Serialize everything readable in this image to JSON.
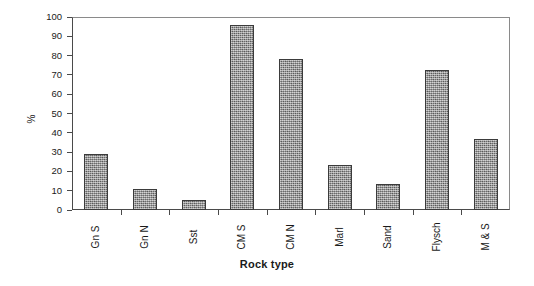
{
  "chart_data": {
    "type": "bar",
    "title": "",
    "subtitle": "",
    "xlabel": "Rock type",
    "ylabel": "%",
    "categories": [
      "Gn S",
      "Gn N",
      "Sst",
      "CM S",
      "CM N",
      "Marl",
      "Sand",
      "Flysch",
      "M & S"
    ],
    "values": [
      29,
      11,
      5,
      96,
      78.5,
      23.5,
      13.5,
      72.5,
      37
    ],
    "ylim": [
      0,
      100
    ],
    "ytick_labels": [
      "0",
      "10",
      "20",
      "30",
      "40",
      "50",
      "60",
      "70",
      "80",
      "90",
      "100"
    ],
    "ytick_values": [
      0,
      10,
      20,
      30,
      40,
      50,
      60,
      70,
      80,
      90,
      100
    ],
    "grid": false,
    "legend": false,
    "legend_position": "none",
    "bar_fill_color": "#878787",
    "bar_edge_color": "#3b3b3b",
    "axis_color": "#4a4a4a",
    "background_color": "#ffffff",
    "xtick_label_rotation": -90
  }
}
